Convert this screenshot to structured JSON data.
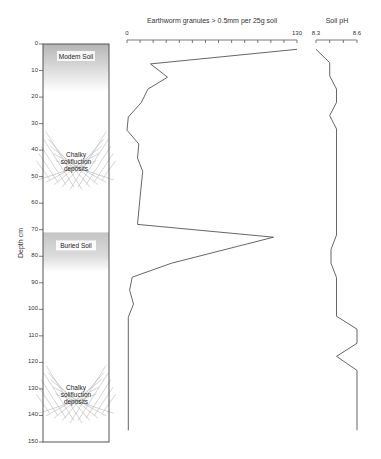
{
  "chart_data": {
    "type": "line",
    "title": "",
    "ylabel": "Depth cm",
    "ylim": [
      0,
      150
    ],
    "y_ticks": [
      0,
      10,
      20,
      30,
      40,
      50,
      60,
      70,
      80,
      90,
      100,
      110,
      120,
      130,
      140,
      150
    ],
    "y_tick_labels": [
      "0",
      "10",
      "20",
      "30",
      "40",
      "50",
      "60",
      "70",
      "80",
      "90",
      "100",
      "110",
      "120",
      "130",
      "140",
      "150"
    ],
    "y_inverted": true,
    "grid": false,
    "panels": [
      {
        "name": "granules",
        "xlabel": "Earthworm granules > 0.5mm per 25g soil",
        "xlim": [
          0,
          130
        ],
        "x_tick_labels": [
          "0",
          "130"
        ],
        "x_minor_step": 10,
        "series": [
          {
            "name": "Earthworm granules",
            "color": "#555555",
            "points": [
              {
                "value": 130,
                "depth": 2
              },
              {
                "value": 18,
                "depth": 7.5
              },
              {
                "value": 31,
                "depth": 12.5
              },
              {
                "value": 16,
                "depth": 17
              },
              {
                "value": 11,
                "depth": 22
              },
              {
                "value": 1,
                "depth": 27.5
              },
              {
                "value": 0,
                "depth": 32.5
              },
              {
                "value": 9,
                "depth": 37.7
              },
              {
                "value": 8,
                "depth": 43
              },
              {
                "value": 12,
                "depth": 48
              },
              {
                "value": 10,
                "depth": 57.7
              },
              {
                "value": 8,
                "depth": 68
              },
              {
                "value": 112,
                "depth": 72.8
              },
              {
                "value": 34,
                "depth": 82.6
              },
              {
                "value": 4,
                "depth": 87.9
              },
              {
                "value": 2,
                "depth": 92.8
              },
              {
                "value": 5,
                "depth": 98
              },
              {
                "value": 1,
                "depth": 103
              },
              {
                "value": 1,
                "depth": 145.6
              }
            ]
          }
        ]
      },
      {
        "name": "ph",
        "xlabel": "Soil pH",
        "xlim": [
          8.3,
          8.6
        ],
        "x_tick_labels": [
          "8.3",
          "8.6"
        ],
        "x_minor_step": 0.1,
        "series": [
          {
            "name": "Soil pH",
            "color": "#555555",
            "points": [
              {
                "value": 8.3,
                "depth": 2
              },
              {
                "value": 8.4,
                "depth": 7
              },
              {
                "value": 8.4,
                "depth": 12
              },
              {
                "value": 8.45,
                "depth": 17
              },
              {
                "value": 8.45,
                "depth": 22
              },
              {
                "value": 8.4,
                "depth": 27
              },
              {
                "value": 8.45,
                "depth": 32
              },
              {
                "value": 8.45,
                "depth": 72
              },
              {
                "value": 8.41,
                "depth": 77.4
              },
              {
                "value": 8.41,
                "depth": 82.6
              },
              {
                "value": 8.45,
                "depth": 88
              },
              {
                "value": 8.45,
                "depth": 102.6
              },
              {
                "value": 8.6,
                "depth": 107.5
              },
              {
                "value": 8.6,
                "depth": 112.8
              },
              {
                "value": 8.45,
                "depth": 117.7
              },
              {
                "value": 8.6,
                "depth": 123
              },
              {
                "value": 8.6,
                "depth": 145.6
              }
            ]
          }
        ]
      }
    ],
    "stratigraphy": [
      {
        "label": "Modem Soil",
        "top": 0,
        "bottom": 10,
        "fill": "gradient",
        "color": "#b8b8b8"
      },
      {
        "label": "Chalky solifluction deposits",
        "lines": [
          "Chalky",
          "solifluction",
          "deposits"
        ],
        "center": 44,
        "fill": "hatch",
        "color": "#aaaaaa"
      },
      {
        "label": "Buried Soil",
        "top": 71,
        "bottom": 86,
        "fill": "band",
        "color": "#cccccc"
      },
      {
        "label": "Chalky solifluction deposits",
        "lines": [
          "Chalky",
          "solifluction",
          "deposits"
        ],
        "center": 132,
        "fill": "hatch",
        "color": "#aaaaaa"
      }
    ]
  }
}
